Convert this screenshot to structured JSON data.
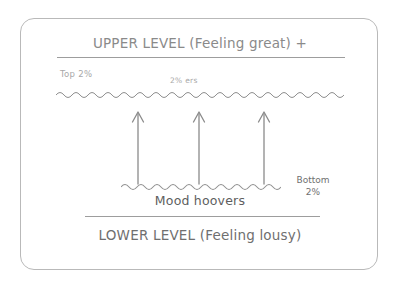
{
  "diagram": {
    "title_top": "UPPER LEVEL (Feeling great) +",
    "title_bottom": "LOWER LEVEL (Feeling lousy)",
    "labels": {
      "top_percentile": "Top 2%",
      "percenters": "2% ers",
      "bottom_percentile_line1": "Bottom",
      "bottom_percentile_line2": "2%",
      "mood_hoovers": "Mood hoovers"
    },
    "colors": {
      "frame": "#b9b9b9",
      "rule": "#9d9d9d",
      "wave": "#8f8f8f",
      "arrow": "#8a8a8a",
      "text_primary": "#6f6f6f",
      "text_secondary": "#8a8a8a",
      "text_faint": "#a8a8a8",
      "background": "#ffffff"
    },
    "arrow_count": 3,
    "arrow_direction": "up"
  }
}
